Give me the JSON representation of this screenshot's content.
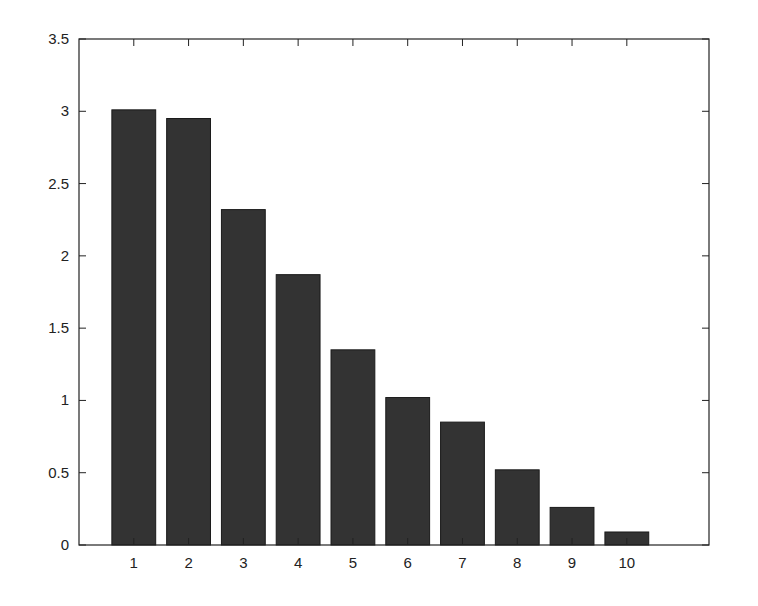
{
  "chart_data": {
    "type": "bar",
    "title": "",
    "xlabel": "",
    "ylabel": "",
    "categories": [
      "1",
      "2",
      "3",
      "4",
      "5",
      "6",
      "7",
      "8",
      "9",
      "10"
    ],
    "values": [
      3.01,
      2.95,
      2.32,
      1.87,
      1.35,
      1.02,
      0.85,
      0.52,
      0.26,
      0.09
    ],
    "ylim": [
      0,
      3.5
    ],
    "xlim": [
      0,
      11.5
    ],
    "yticks": [
      "0",
      "0.5",
      "1",
      "1.5",
      "2",
      "2.5",
      "3",
      "3.5"
    ],
    "grid": false,
    "legend": null,
    "bar_color": "#333333"
  }
}
